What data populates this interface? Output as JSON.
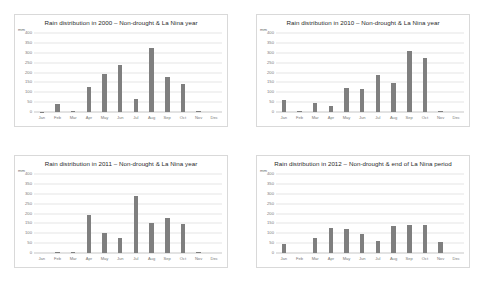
{
  "figure": {
    "background": "#ffffff",
    "panel_border": "#d9d9d9",
    "bar_color": "#7f7f7f",
    "grid_color": "#e6e6e6",
    "text_color": "#2a2a2a",
    "tick_color": "#7a7a7a",
    "layout": "2x2"
  },
  "chart_data": [
    {
      "type": "bar",
      "title": "Rain distribution in 2000 – Non-drought & La Nina year",
      "xlabel": "",
      "ylabel": "mm",
      "ylim": [
        0,
        400
      ],
      "yticks": [
        0,
        50,
        100,
        150,
        200,
        250,
        300,
        350,
        400
      ],
      "grid": true,
      "legend": "none",
      "categories": [
        "Jan",
        "Feb",
        "Mar",
        "Apr",
        "May",
        "Jun",
        "Jul",
        "Aug",
        "Sep",
        "Oct",
        "Nov",
        "Dec"
      ],
      "values": [
        2,
        40,
        6,
        128,
        190,
        240,
        65,
        322,
        175,
        143,
        4,
        0
      ]
    },
    {
      "type": "bar",
      "title": "Rain distribution in 2010 – Non-drought & La Nina year",
      "xlabel": "",
      "ylabel": "mm",
      "ylim": [
        0,
        400
      ],
      "yticks": [
        0,
        50,
        100,
        150,
        200,
        250,
        300,
        350,
        400
      ],
      "grid": true,
      "legend": "none",
      "categories": [
        "Jan",
        "Feb",
        "Mar",
        "Apr",
        "May",
        "Jun",
        "Jul",
        "Aug",
        "Sep",
        "Oct",
        "Nov",
        "Dec"
      ],
      "values": [
        60,
        3,
        45,
        30,
        120,
        116,
        188,
        145,
        310,
        275,
        3,
        0
      ]
    },
    {
      "type": "bar",
      "title": "Rain distribution in 2011 – Non-drought & La Nina year",
      "xlabel": "",
      "ylabel": "mm",
      "ylim": [
        0,
        400
      ],
      "yticks": [
        0,
        50,
        100,
        150,
        200,
        250,
        300,
        350,
        400
      ],
      "grid": true,
      "legend": "none",
      "categories": [
        "Jan",
        "Feb",
        "Mar",
        "Apr",
        "May",
        "Jun",
        "Jul",
        "Aug",
        "Sep",
        "Oct",
        "Nov",
        "Dec"
      ],
      "values": [
        0,
        6,
        6,
        190,
        100,
        78,
        288,
        152,
        178,
        148,
        6,
        0
      ]
    },
    {
      "type": "bar",
      "title": "Rain distribution  in 2012 – Non-drought & end of La Nina period",
      "xlabel": "",
      "ylabel": "mm",
      "ylim": [
        0,
        400
      ],
      "yticks": [
        0,
        50,
        100,
        150,
        200,
        250,
        300,
        350,
        400
      ],
      "grid": true,
      "legend": "none",
      "categories": [
        "Jan",
        "Feb",
        "Mar",
        "Apr",
        "May",
        "Jun",
        "Jul",
        "Aug",
        "Sep",
        "Oct",
        "Nov",
        "Dec"
      ],
      "values": [
        48,
        0,
        78,
        128,
        122,
        95,
        62,
        135,
        140,
        140,
        55,
        0
      ]
    }
  ]
}
